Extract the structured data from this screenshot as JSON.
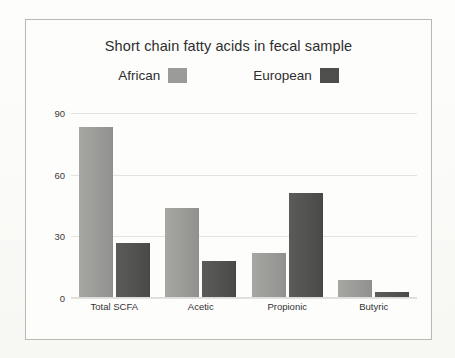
{
  "chart_data": {
    "type": "bar",
    "title": "Short chain fatty acids in fecal sample",
    "xlabel": "",
    "ylabel": "",
    "categories": [
      "Total SCFA",
      "Acetic",
      "Propionic",
      "Butyric"
    ],
    "series": [
      {
        "name": "African",
        "color": "#9b9b98",
        "values": [
          83,
          44,
          22,
          9
        ]
      },
      {
        "name": "European",
        "color": "#525250",
        "values": [
          27,
          18,
          51,
          3
        ]
      }
    ],
    "ylim": [
      0,
      90
    ],
    "yticks": [
      "0",
      "30",
      "60",
      "90"
    ],
    "ytick_values": [
      0,
      30,
      60,
      90
    ],
    "grid": true,
    "legend_position": "top-center"
  },
  "legend": {
    "entries": [
      {
        "label": "African",
        "swatch_color": "#9b9b98"
      },
      {
        "label": "European",
        "swatch_color": "#4e4e4c"
      }
    ]
  },
  "colors": {
    "page_background": "#fbfbf9",
    "frame_border": "#b9b9b4",
    "gridline": "#e3e3df",
    "text": "#2e2e2e",
    "african_bar": "#9b9b98",
    "european_bar": "#525250"
  }
}
